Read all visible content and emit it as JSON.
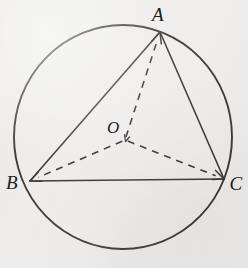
{
  "figure": {
    "background_color": "#eeedeb",
    "stroke_color": "#333132",
    "labels": {
      "vertex_a": "A",
      "vertex_b": "B",
      "vertex_c": "C",
      "center_o": "O"
    }
  },
  "chart_data": {
    "type": "diagram",
    "canvas": {
      "width": 248,
      "height": 268
    },
    "circle": {
      "name": "circumcircle",
      "center_x": 123,
      "center_y": 137,
      "radius_x": 109,
      "radius_y": 112,
      "stroke": "#333132",
      "stroke_width": 1.9,
      "fill": "none"
    },
    "points": [
      {
        "id": "A",
        "label": "A",
        "x": 160,
        "y": 32,
        "label_x": 158,
        "label_y": 14
      },
      {
        "id": "B",
        "label": "B",
        "x": 30,
        "y": 181,
        "label_x": 12,
        "label_y": 182
      },
      {
        "id": "C",
        "label": "C",
        "x": 224,
        "y": 179,
        "label_x": 236,
        "label_y": 183
      },
      {
        "id": "O",
        "label": "O",
        "x": 125,
        "y": 140,
        "label_x": 113,
        "label_y": 127
      }
    ],
    "solid_segments": [
      {
        "name": "side-AB",
        "from": "A",
        "to": "B",
        "x1": 160,
        "y1": 32,
        "x2": 30,
        "y2": 181
      },
      {
        "name": "side-AC",
        "from": "A",
        "to": "C",
        "x1": 160,
        "y1": 32,
        "x2": 224,
        "y2": 179
      },
      {
        "name": "side-BC",
        "from": "B",
        "to": "C",
        "x1": 30,
        "y1": 181,
        "x2": 224,
        "y2": 179
      }
    ],
    "dashed_vectors": [
      {
        "name": "vector-OA",
        "from": "O",
        "to": "A",
        "x1": 125,
        "y1": 140,
        "x2": 160,
        "y2": 32,
        "arrowhead": true
      },
      {
        "name": "vector-OB",
        "from": "O",
        "to": "B",
        "x1": 125,
        "y1": 140,
        "x2": 30,
        "y2": 181,
        "arrowhead": true
      },
      {
        "name": "vector-OC",
        "from": "O",
        "to": "C",
        "x1": 125,
        "y1": 140,
        "x2": 224,
        "y2": 179,
        "arrowhead": true
      }
    ],
    "line_styles": {
      "solid_stroke_width": 1.6,
      "dashed_stroke_width": 1.6,
      "dash_pattern": "7 6"
    },
    "grid": false,
    "legend": null
  }
}
